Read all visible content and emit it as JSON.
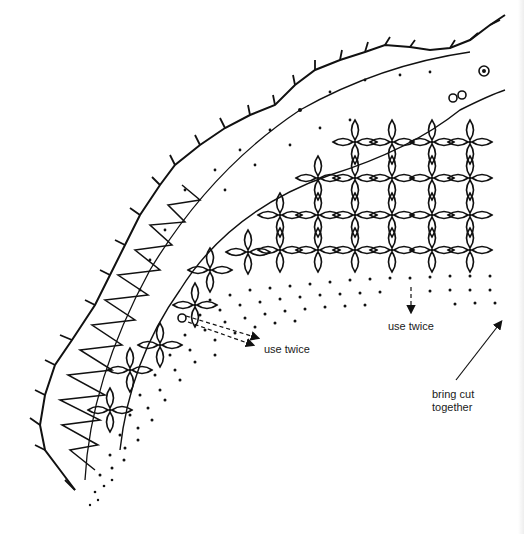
{
  "diagram": {
    "type": "lace-pattern",
    "colors": {
      "ink": "#111111",
      "background": "#ffffff"
    },
    "labels": [
      {
        "id": "use-twice-left",
        "text": "use twice",
        "x": 264,
        "y": 343
      },
      {
        "id": "use-twice-right",
        "text": "use twice",
        "x": 388,
        "y": 320
      },
      {
        "id": "bring-cut-together",
        "text": "bring cut\ntogether",
        "x": 432,
        "y": 388
      }
    ],
    "arrows": [
      {
        "id": "arrow-use-twice-left",
        "from": [
          188,
          322
        ],
        "to": [
          253,
          345
        ]
      },
      {
        "id": "arrow-use-twice-right",
        "from": [
          411,
          287
        ],
        "to": [
          411,
          312
        ]
      },
      {
        "id": "arrow-bring-cut",
        "from": [
          456,
          380
        ],
        "to": [
          501,
          322
        ]
      }
    ],
    "regions": [
      "picot-edge",
      "zigzag-band",
      "open-dotted-band",
      "leaf-grid",
      "dotted-ground"
    ]
  }
}
